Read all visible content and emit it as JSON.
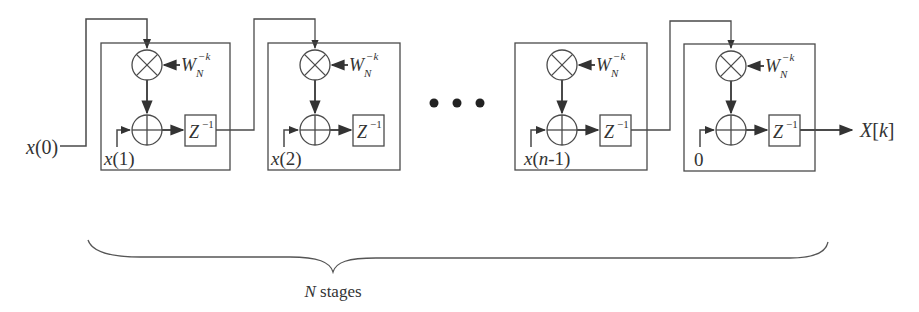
{
  "figure": {
    "line_color": "#4a4a4a",
    "bg_color": "#ffffff"
  },
  "input": {
    "label": "x(0)"
  },
  "stages": [
    {
      "id": "stage-1",
      "twiddle_base": "W",
      "twiddle_sub": "N",
      "twiddle_sup": "−k",
      "delay_label": "Z",
      "delay_sup": "−1",
      "adder_input": "x(1)"
    },
    {
      "id": "stage-2",
      "twiddle_base": "W",
      "twiddle_sub": "N",
      "twiddle_sup": "−k",
      "delay_label": "Z",
      "delay_sup": "−1",
      "adder_input": "x(2)"
    },
    {
      "id": "stage-n-1",
      "twiddle_base": "W",
      "twiddle_sub": "N",
      "twiddle_sup": "−k",
      "delay_label": "Z",
      "delay_sup": "−1",
      "adder_input": "x(n-1)"
    },
    {
      "id": "stage-N",
      "twiddle_base": "W",
      "twiddle_sub": "N",
      "twiddle_sup": "−k",
      "delay_label": "Z",
      "delay_sup": "−1",
      "adder_input": "0"
    }
  ],
  "ellipsis": "• • •",
  "output": {
    "label": "X[k]"
  },
  "brace": {
    "label_var": "N",
    "label_text": " stages"
  }
}
